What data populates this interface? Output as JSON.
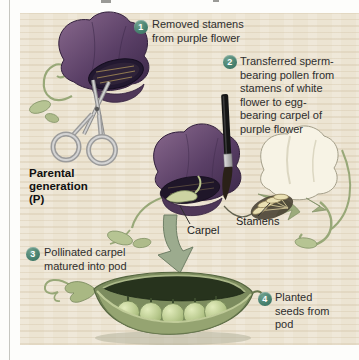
{
  "figure": {
    "steps": [
      {
        "number": "1",
        "text": "Removed stamens\nfrom purple flower"
      },
      {
        "number": "2",
        "text": "Transferred sperm-\nbearing pollen from\nstamens of white\nflower to egg-\nbearing carpel of\npurple flower"
      },
      {
        "number": "3",
        "text": "Pollinated carpel\nmatured into pod"
      },
      {
        "number": "4",
        "text": "Planted\nseeds from\npod"
      }
    ],
    "labels": {
      "parental_generation": "Parental\ngeneration\n(P)",
      "carpel": "Carpel",
      "stamens": "Stamens"
    },
    "colors": {
      "step_badge": "#46806e",
      "panel_background": "#ece4d2",
      "purple_flower": "#543962",
      "white_flower": "#f7f3e5",
      "pea_green": "#b7c88c",
      "arrow_green": "#9cab8e"
    }
  }
}
